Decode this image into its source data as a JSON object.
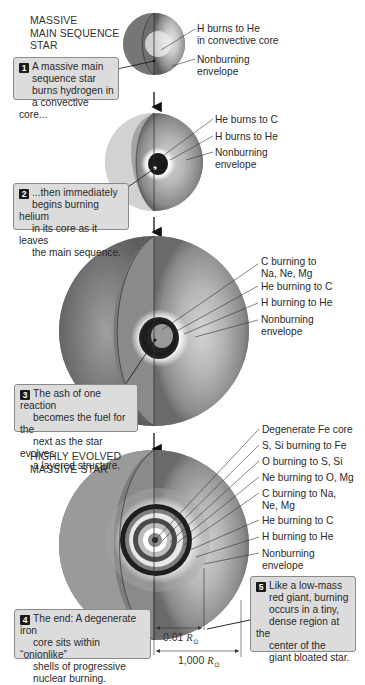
{
  "stages": [
    {
      "heading": [
        "MASSIVE",
        "MAIN SEQUENCE",
        "STAR"
      ],
      "callout_number": "1",
      "callout_text": [
        "A massive main",
        "sequence star",
        "burns hydrogen in",
        "a convective core..."
      ],
      "labels": [
        [
          "H burns to He",
          "in convective core"
        ],
        [
          "Nonburning",
          "envelope"
        ]
      ]
    },
    {
      "callout_number": "2",
      "callout_text": [
        "...then immediately",
        "begins burning helium",
        "in its core as it leaves",
        "the main sequence."
      ],
      "labels": [
        [
          "He burns to C"
        ],
        [
          "H burns to He"
        ],
        [
          "Nonburning",
          "envelope"
        ]
      ]
    },
    {
      "callout_number": "3",
      "callout_text": [
        "The ash of one reaction",
        "becomes the fuel for the",
        "next as the star evolves",
        "a layered structure."
      ],
      "labels": [
        [
          "C burning to",
          "Na, Ne, Mg"
        ],
        [
          "He burning to C"
        ],
        [
          "H burning to He"
        ],
        [
          "Nonburning",
          "envelope"
        ]
      ]
    },
    {
      "heading": [
        "HIGHLY EVOLVED",
        "MASSIVE STAR"
      ],
      "callout_number": "4",
      "callout_text": [
        "The end: A degenerate iron",
        "core sits within “onionlike”",
        "shells of  progressive",
        "nuclear burning."
      ],
      "labels": [
        [
          "Degenerate Fe core"
        ],
        [
          "S, Si burning to Fe"
        ],
        [
          "O burning to S, Si"
        ],
        [
          "Ne burning to O, Mg"
        ],
        [
          "C burning to Na,",
          "Ne, Mg"
        ],
        [
          "He burning to C"
        ],
        [
          "H burning to He"
        ],
        [
          "Nonburning",
          "envelope"
        ]
      ]
    }
  ],
  "callout5": {
    "number": "5",
    "text": [
      "Like a low-mass",
      "red giant, burning",
      "occurs in a tiny,",
      "dense region at the",
      "center of the",
      "giant bloated star."
    ]
  },
  "scale_bars": [
    {
      "value": "0.01",
      "unit": "R",
      "subscript": "⊙"
    },
    {
      "value": "1,000",
      "unit": "R",
      "subscript": "⊙"
    }
  ],
  "colors": {
    "shell_dark": "#1c1c1c",
    "envelope_mid": "#8c8c8c",
    "envelope_light": "#bdbdbd",
    "callout_fill": "#dcdcdc",
    "callout_border": "#8a8a8a",
    "number_badge": "#1a1a1a"
  }
}
